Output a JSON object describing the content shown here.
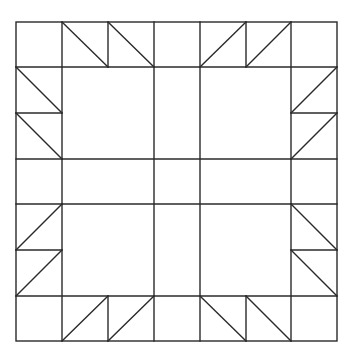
{
  "diagram": {
    "type": "quilt-block",
    "stroke_color": "#2a2a2a",
    "background": "#ffffff",
    "outer_border": {
      "x1": 16,
      "y1": 22,
      "x2": 337,
      "y2": 341
    },
    "lines": [
      [
        16,
        67,
        337,
        67
      ],
      [
        16,
        296,
        337,
        296
      ],
      [
        62,
        22,
        62,
        341
      ],
      [
        291,
        22,
        291,
        341
      ],
      [
        154,
        22,
        154,
        341
      ],
      [
        200,
        22,
        200,
        341
      ],
      [
        62,
        159,
        291,
        159
      ],
      [
        62,
        204,
        291,
        204
      ],
      [
        16,
        159,
        62,
        159
      ],
      [
        16,
        204,
        62,
        204
      ],
      [
        291,
        159,
        337,
        159
      ],
      [
        291,
        204,
        337,
        204
      ],
      [
        108,
        22,
        108,
        67
      ],
      [
        246,
        22,
        246,
        67
      ],
      [
        108,
        296,
        108,
        341
      ],
      [
        246,
        296,
        246,
        341
      ],
      [
        16,
        113,
        62,
        113
      ],
      [
        16,
        250,
        62,
        250
      ],
      [
        291,
        113,
        337,
        113
      ],
      [
        291,
        250,
        337,
        250
      ]
    ],
    "diagonals": [
      [
        62,
        22,
        108,
        67
      ],
      [
        108,
        22,
        154,
        67
      ],
      [
        200,
        67,
        246,
        22
      ],
      [
        246,
        67,
        291,
        22
      ],
      [
        16,
        67,
        62,
        113
      ],
      [
        16,
        113,
        62,
        159
      ],
      [
        291,
        113,
        337,
        67
      ],
      [
        291,
        159,
        337,
        113
      ],
      [
        16,
        250,
        62,
        204
      ],
      [
        16,
        296,
        62,
        250
      ],
      [
        291,
        204,
        337,
        250
      ],
      [
        291,
        250,
        337,
        296
      ],
      [
        62,
        341,
        108,
        296
      ],
      [
        108,
        341,
        154,
        296
      ],
      [
        200,
        296,
        246,
        341
      ],
      [
        246,
        296,
        291,
        341
      ]
    ]
  }
}
